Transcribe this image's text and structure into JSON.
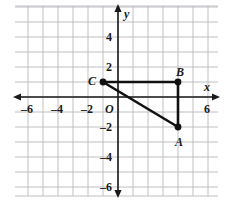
{
  "chart_data": {
    "type": "scatter",
    "title": "",
    "xlabel": "x",
    "ylabel": "y",
    "xlim": [
      -7,
      7
    ],
    "ylim": [
      -6.6,
      5.4
    ],
    "grid": true,
    "grid_step": 1,
    "origin_label": "O",
    "x_ticks": [
      {
        "value": -6,
        "label": "–6"
      },
      {
        "value": -4,
        "label": "–4"
      },
      {
        "value": -2,
        "label": "–2"
      },
      {
        "value": 6,
        "label": "6"
      }
    ],
    "y_ticks": [
      {
        "value": 4,
        "label": "4"
      },
      {
        "value": 2,
        "label": "2"
      },
      {
        "value": -2,
        "label": "–2"
      },
      {
        "value": -4,
        "label": "–4"
      },
      {
        "value": -6,
        "label": "–6"
      }
    ],
    "points": [
      {
        "name": "A",
        "label": "A",
        "x": 4,
        "y": -2
      },
      {
        "name": "B",
        "label": "B",
        "x": 4,
        "y": 1
      },
      {
        "name": "C",
        "label": "C",
        "x": -1,
        "y": 1
      }
    ],
    "segments": [
      {
        "from": "C",
        "to": "B"
      },
      {
        "from": "B",
        "to": "A"
      },
      {
        "from": "A",
        "to": "C"
      }
    ],
    "colors": {
      "grid": "#b9b9c0",
      "axis": "#1a1a1a",
      "shape": "#111111",
      "background": "#ffffff"
    }
  }
}
